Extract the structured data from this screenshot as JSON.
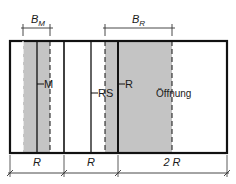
{
  "diagram": {
    "colors": {
      "line": "#111111",
      "shade": "#c4c4c4",
      "dim_line": "#333333"
    },
    "top_dimensions": {
      "b_m": {
        "main": "B",
        "sub": "M"
      },
      "b_r": {
        "main": "B",
        "sub": "R"
      }
    },
    "element_labels": {
      "m": "M",
      "rs": "RS",
      "r": "R",
      "opening": "Öffnung"
    },
    "bottom_dimensions": [
      {
        "label": "R"
      },
      {
        "label": "R"
      },
      {
        "label": "2 R"
      }
    ]
  }
}
